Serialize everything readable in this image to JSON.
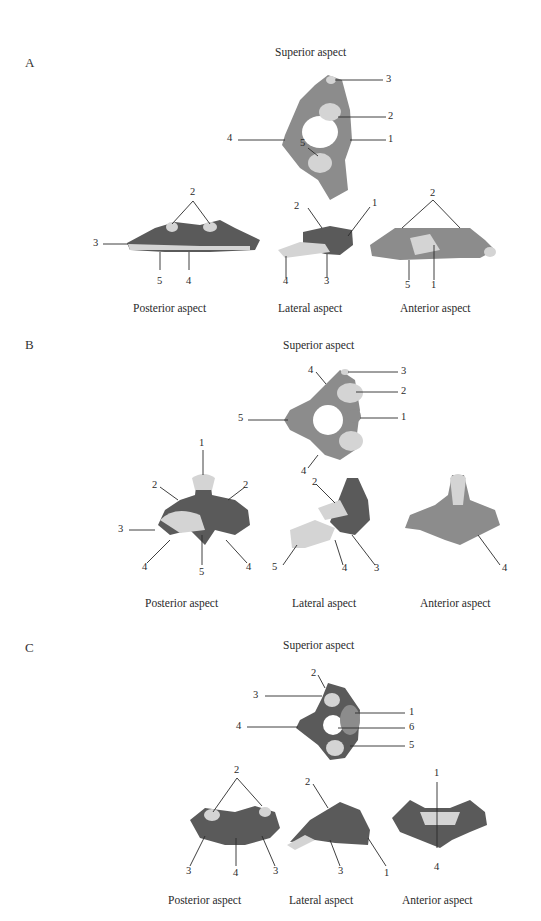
{
  "panels": [
    {
      "letter": "A",
      "views": {
        "superior": {
          "caption": "Superior aspect",
          "labels": [
            "3",
            "2",
            "4",
            "1",
            "5"
          ]
        },
        "posterior": {
          "caption": "Posterior aspect",
          "labels": [
            "2",
            "3",
            "5",
            "4"
          ]
        },
        "lateral": {
          "caption": "Lateral aspect",
          "labels": [
            "2",
            "1",
            "4",
            "3"
          ]
        },
        "anterior": {
          "caption": "Anterior aspect",
          "labels": [
            "2",
            "5",
            "1"
          ]
        }
      }
    },
    {
      "letter": "B",
      "views": {
        "superior": {
          "caption": "Superior aspect",
          "labels": [
            "4",
            "3",
            "2",
            "5",
            "1",
            "4"
          ]
        },
        "posterior": {
          "caption": "Posterior aspect",
          "labels": [
            "1",
            "2",
            "2",
            "3",
            "4",
            "5",
            "4"
          ]
        },
        "lateral": {
          "caption": "Lateral aspect",
          "labels": [
            "2",
            "5",
            "4",
            "3"
          ]
        },
        "anterior": {
          "caption": "Anterior aspect",
          "labels": [
            "4"
          ]
        }
      }
    },
    {
      "letter": "C",
      "views": {
        "superior": {
          "caption": "Superior aspect",
          "labels": [
            "2",
            "3",
            "1",
            "4",
            "6",
            "5"
          ]
        },
        "posterior": {
          "caption": "Posterior aspect",
          "labels": [
            "2",
            "3",
            "4",
            "3"
          ]
        },
        "lateral": {
          "caption": "Lateral aspect",
          "labels": [
            "2",
            "3",
            "1"
          ]
        },
        "anterior": {
          "caption": "Anterior aspect",
          "labels": [
            "1",
            "4"
          ]
        }
      }
    }
  ]
}
